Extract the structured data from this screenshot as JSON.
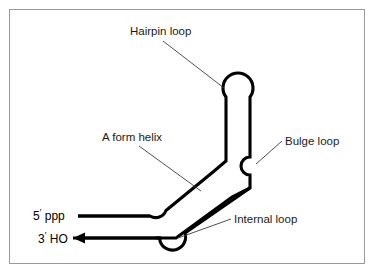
{
  "figure": {
    "background_color": "#ffffff",
    "border_color": "#9a9a9a",
    "chain_color": "#000000",
    "leader_color": "#3c3c3c",
    "text_color": "#1a1a1a"
  },
  "labels": {
    "hairpin_loop": "Hairpin loop",
    "a_form_helix": "A form helix",
    "bulge_loop": "Bulge loop",
    "internal_loop": "Internal loop"
  },
  "termini": {
    "five_prime_digit": "5",
    "five_prime_mark": "′",
    "five_prime_group": " ppp",
    "three_prime_digit": "3",
    "three_prime_mark": "′",
    "three_prime_group": " HO"
  },
  "structure": {
    "hairpin_loop_center_x": 238,
    "hairpin_loop_center_y": 82,
    "hairpin_loop_radius": 15,
    "bulge_loop_center_x": 252,
    "bulge_loop_center_y": 166,
    "bulge_loop_radius": 9,
    "internal_loop_center_x": 168,
    "internal_loop_center_y": 232,
    "internal_loop_radius": 12,
    "stem_left_x": 226,
    "stem_right_x": 250,
    "five_prime_line_y": 216,
    "three_prime_line_y": 238,
    "five_prime_line_start_x": 78,
    "three_prime_arrow_tip_x": 73
  },
  "leader_lines": {
    "hairpin": {
      "x1": 163,
      "y1": 41,
      "x2": 224,
      "y2": 88
    },
    "helix": {
      "x1": 139,
      "y1": 146,
      "x2": 200,
      "y2": 190
    },
    "bulge": {
      "x1": 281,
      "y1": 141,
      "x2": 256,
      "y2": 163
    },
    "internal": {
      "x1": 231,
      "y1": 219,
      "x2": 180,
      "y2": 237
    }
  },
  "label_positions": {
    "hairpin": {
      "x": 130,
      "y": 35
    },
    "helix": {
      "x": 102,
      "y": 141
    },
    "bulge": {
      "x": 285,
      "y": 145
    },
    "internal": {
      "x": 234,
      "y": 223
    },
    "five_prime": {
      "x": 33,
      "y": 220
    },
    "three_prime": {
      "x": 38,
      "y": 242
    }
  }
}
